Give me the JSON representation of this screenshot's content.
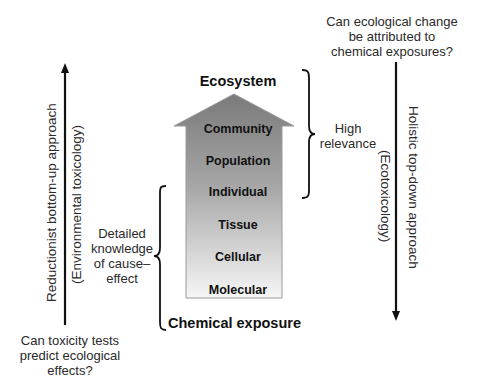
{
  "diagram": {
    "title_top": "Ecosystem",
    "title_bottom": "Chemical exposure",
    "levels": [
      {
        "label": "Community"
      },
      {
        "label": "Population"
      },
      {
        "label": "Individual"
      },
      {
        "label": "Tissue"
      },
      {
        "label": "Cellular"
      },
      {
        "label": "Molecular"
      }
    ],
    "left_axis": {
      "label": "Reductionist bottom-up approach",
      "sublabel": "(Environmental toxicology)",
      "question": [
        "Can toxicity tests",
        "predict ecological",
        "effects?"
      ],
      "direction": "up"
    },
    "right_axis": {
      "label": "Holistic top-down approach",
      "sublabel": "(Ecotoxicology)",
      "question": [
        "Can ecological change",
        "be attributed to",
        "chemical exposures?"
      ],
      "direction": "down"
    },
    "brace_left": {
      "text": [
        "Detailed",
        "knowledge",
        "of cause–",
        "effect"
      ]
    },
    "brace_right": {
      "text": [
        "High",
        "relevance"
      ]
    },
    "colors": {
      "arrow_top": "#7a7a7a",
      "arrow_bottom": "#f4f4f4",
      "stroke": "#111111"
    }
  }
}
